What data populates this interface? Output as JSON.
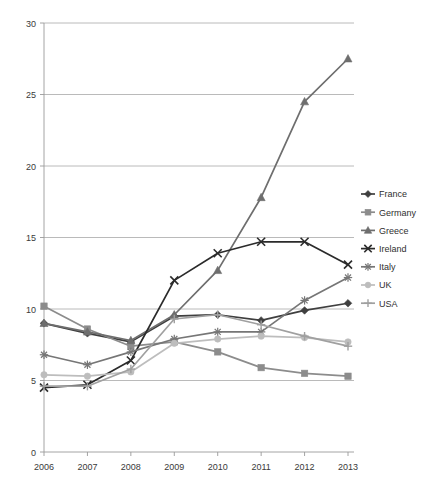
{
  "chart_data": {
    "type": "line",
    "title": "",
    "subtitle": "",
    "xlabel": "",
    "ylabel": "",
    "categories": [
      "2006",
      "2007",
      "2008",
      "2009",
      "2010",
      "2011",
      "2012",
      "2013"
    ],
    "x": [
      2006,
      2007,
      2008,
      2009,
      2010,
      2011,
      2012,
      2013
    ],
    "xlim": [
      2006,
      2013
    ],
    "ylim": [
      0,
      30
    ],
    "yticks": [
      0,
      5,
      10,
      15,
      20,
      25,
      30
    ],
    "ytick_labels": [
      "0",
      "5",
      "10",
      "15",
      "20",
      "25",
      "30"
    ],
    "grid": true,
    "grid_axis": "y",
    "legend_position": "right",
    "series": [
      {
        "name": "France",
        "marker": "diamond",
        "color": "#3f3f3f",
        "values": [
          9.0,
          8.3,
          7.7,
          9.5,
          9.6,
          9.2,
          9.9,
          10.4
        ]
      },
      {
        "name": "Germany",
        "marker": "square",
        "color": "#8c8c8c",
        "values": [
          10.2,
          8.6,
          7.4,
          7.7,
          7.0,
          5.9,
          5.5,
          5.3
        ]
      },
      {
        "name": "Greece",
        "marker": "triangle",
        "color": "#6e6e6e",
        "values": [
          9.0,
          8.4,
          7.8,
          9.6,
          12.7,
          17.8,
          24.5,
          27.5
        ]
      },
      {
        "name": "Ireland",
        "marker": "x",
        "color": "#2b2b2b",
        "values": [
          4.5,
          4.7,
          6.4,
          12.0,
          13.9,
          14.7,
          14.7,
          13.1
        ]
      },
      {
        "name": "Italy",
        "marker": "asterisk",
        "color": "#767676",
        "values": [
          6.8,
          6.1,
          7.0,
          7.9,
          8.4,
          8.4,
          10.6,
          12.2
        ]
      },
      {
        "name": "UK",
        "marker": "circle",
        "color": "#bdbdbd",
        "values": [
          5.4,
          5.3,
          5.6,
          7.6,
          7.9,
          8.1,
          8.0,
          7.7
        ]
      },
      {
        "name": "USA",
        "marker": "plus",
        "color": "#a0a0a0",
        "values": [
          4.6,
          4.6,
          5.8,
          9.3,
          9.6,
          8.9,
          8.1,
          7.4
        ]
      }
    ]
  },
  "axes": {
    "y_tick_labels": [
      "30",
      "25",
      "20",
      "15",
      "10",
      "5",
      "0"
    ],
    "x_tick_labels": [
      "2006",
      "2007",
      "2008",
      "2009",
      "2010",
      "2011",
      "2012",
      "2013"
    ]
  },
  "legend": {
    "entries": [
      {
        "label": "France"
      },
      {
        "label": "Germany"
      },
      {
        "label": "Greece"
      },
      {
        "label": "Ireland"
      },
      {
        "label": "Italy"
      },
      {
        "label": "UK"
      },
      {
        "label": "USA"
      }
    ]
  },
  "colors": {
    "background": "#ffffff",
    "gridline": "#a8a8a8",
    "axis": "#9a9a9a",
    "text": "#3a3a3a"
  }
}
